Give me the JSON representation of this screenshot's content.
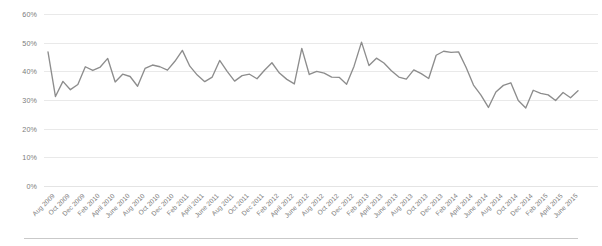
{
  "chart_data": {
    "type": "line",
    "title": "",
    "subtitle": "",
    "xlabel": "",
    "ylabel": "",
    "ylim": [
      0,
      60
    ],
    "y_tick_labels": [
      "60%",
      "50%",
      "40%",
      "30%",
      "20%",
      "10%",
      "0%"
    ],
    "y_tick_values": [
      60,
      50,
      40,
      30,
      20,
      10,
      0
    ],
    "grid": true,
    "grid_axis": "y",
    "legend": "none",
    "series_color": "#8d8d8d",
    "x_tick_labels": [
      "Aug 2009",
      "Oct 2009",
      "Dec 2009",
      "Feb 2010",
      "April 2010",
      "June 2010",
      "Aug 2010",
      "Oct 2010",
      "Dec 2010",
      "Feb 2011",
      "April 2011",
      "June 2011",
      "Aug 2011",
      "Oct 2011",
      "Dec 2011",
      "Feb 2012",
      "April 2012",
      "June 2012",
      "Aug 2012",
      "Oct 2012",
      "Dec 2012",
      "Feb 2013",
      "April 2013",
      "June 2013",
      "Aug 2013",
      "Oct 2013",
      "Dec 2013",
      "Feb 2014",
      "April 2014",
      "June 2014",
      "Aug 2014",
      "Oct 2014",
      "Dec 2014",
      "Feb 2015",
      "April 2015",
      "June 2015"
    ],
    "x": [
      "Aug 2009",
      "Sep 2009",
      "Oct 2009",
      "Nov 2009",
      "Dec 2009",
      "Jan 2010",
      "Feb 2010",
      "Mar 2010",
      "April 2010",
      "May 2010",
      "June 2010",
      "July 2010",
      "Aug 2010",
      "Sep 2010",
      "Oct 2010",
      "Nov 2010",
      "Dec 2010",
      "Jan 2011",
      "Feb 2011",
      "Mar 2011",
      "April 2011",
      "May 2011",
      "June 2011",
      "July 2011",
      "Aug 2011",
      "Sep 2011",
      "Oct 2011",
      "Nov 2011",
      "Dec 2011",
      "Jan 2012",
      "Feb 2012",
      "Mar 2012",
      "April 2012",
      "May 2012",
      "June 2012",
      "July 2012",
      "Aug 2012",
      "Sep 2012",
      "Oct 2012",
      "Nov 2012",
      "Dec 2012",
      "Jan 2013",
      "Feb 2013",
      "Mar 2013",
      "April 2013",
      "May 2013",
      "June 2013",
      "July 2013",
      "Aug 2013",
      "Sep 2013",
      "Oct 2013",
      "Nov 2013",
      "Dec 2013",
      "Jan 2014",
      "Feb 2014",
      "Mar 2014",
      "April 2014",
      "May 2014",
      "June 2014",
      "July 2014",
      "Aug 2014",
      "Sep 2014",
      "Oct 2014",
      "Nov 2014",
      "Dec 2014",
      "Jan 2015",
      "Feb 2015",
      "Mar 2015",
      "April 2015",
      "May 2015",
      "June 2015",
      "July 2015"
    ],
    "values": [
      46.8,
      31.2,
      36.5,
      33.6,
      35.4,
      41.6,
      40.3,
      41.5,
      44.5,
      36.3,
      39.0,
      38.2,
      34.8,
      41.0,
      42.2,
      41.6,
      40.4,
      43.5,
      47.3,
      41.8,
      38.7,
      36.4,
      38.0,
      43.8,
      40.0,
      36.6,
      38.5,
      39.0,
      37.4,
      40.4,
      43.0,
      39.4,
      37.2,
      35.6,
      48.0,
      38.9,
      40.0,
      39.4,
      38.0,
      37.9,
      35.5,
      41.8,
      50.2,
      42.0,
      44.6,
      42.9,
      40.2,
      38.0,
      37.3,
      40.5,
      39.2,
      37.5,
      45.6,
      47.0,
      46.6,
      46.8,
      41.4,
      35.2,
      31.7,
      27.4,
      32.8,
      35.1,
      36.0,
      29.8,
      27.2,
      33.4,
      32.3,
      31.8,
      29.8,
      32.6,
      30.8,
      33.2
    ]
  }
}
